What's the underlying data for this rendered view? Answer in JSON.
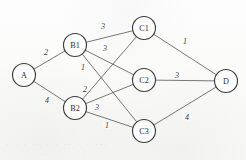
{
  "figure": {
    "kind": "weighted-layered-graph",
    "background_color": "#fbfbfa",
    "stroke_color": "#4a4a4e",
    "node_stroke_color": "#3c3c40",
    "label_color": "#2e2e32"
  },
  "nodes": [
    {
      "id": "A",
      "label": "A",
      "x": 24,
      "y": 75,
      "r": 11.5,
      "layer": "source"
    },
    {
      "id": "B1",
      "label": "B1",
      "x": 75,
      "y": 45,
      "r": 11.5,
      "layer": "b"
    },
    {
      "id": "B2",
      "label": "B2",
      "x": 75,
      "y": 108,
      "r": 11.5,
      "layer": "b"
    },
    {
      "id": "C1",
      "label": "C1",
      "x": 144,
      "y": 28,
      "r": 11.5,
      "layer": "c"
    },
    {
      "id": "C2",
      "label": "C2",
      "x": 144,
      "y": 80,
      "r": 11.5,
      "layer": "c"
    },
    {
      "id": "C3",
      "label": "C3",
      "x": 144,
      "y": 131,
      "r": 11.5,
      "layer": "c"
    },
    {
      "id": "D",
      "label": "D",
      "x": 226,
      "y": 81,
      "r": 11.5,
      "layer": "sink"
    }
  ],
  "edges": [
    {
      "from": "A",
      "to": "B1",
      "weight": "2",
      "lx": 46,
      "ly": 52
    },
    {
      "from": "A",
      "to": "B2",
      "weight": "4",
      "lx": 47,
      "ly": 100
    },
    {
      "from": "B1",
      "to": "C1",
      "weight": "3",
      "lx": 103,
      "ly": 26
    },
    {
      "from": "B1",
      "to": "C2",
      "weight": "3",
      "lx": 105,
      "ly": 48
    },
    {
      "from": "B1",
      "to": "C3",
      "weight": "1",
      "lx": 83,
      "ly": 67
    },
    {
      "from": "B2",
      "to": "C1",
      "weight": "2",
      "lx": 85,
      "ly": 89
    },
    {
      "from": "B2",
      "to": "C2",
      "weight": "3",
      "lx": 97,
      "ly": 107
    },
    {
      "from": "B2",
      "to": "C3",
      "weight": "1",
      "lx": 107,
      "ly": 125
    },
    {
      "from": "C1",
      "to": "D",
      "weight": "1",
      "lx": 185,
      "ly": 41
    },
    {
      "from": "C2",
      "to": "D",
      "weight": "3",
      "lx": 177,
      "ly": 75
    },
    {
      "from": "C3",
      "to": "D",
      "weight": "4",
      "lx": 187,
      "ly": 117
    }
  ],
  "ghost_text": {
    "top_line": "·   ·           ·",
    "bottom_line_1": "·  ·    ·    ·· ·    ·   ··    ·  ·  ··· ·",
    "bottom_line_2": "·   ·· ·   ···  ·  ·   ··  ·   ·   ··  ·"
  }
}
